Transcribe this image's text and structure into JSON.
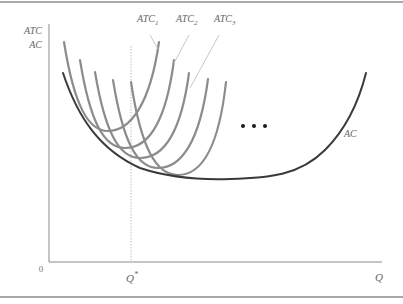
{
  "diagram": {
    "y_axis_label_line1": "ATC",
    "y_axis_label_line2": "AC",
    "x_axis_label": "Q",
    "origin_label": "0",
    "q_star_label": "Q",
    "q_star_superscript": "*",
    "curve_labels": [
      {
        "base": "ATC",
        "sub": "1"
      },
      {
        "base": "ATC",
        "sub": "2"
      },
      {
        "base": "ATC",
        "sub": "3"
      }
    ],
    "ac_label": "AC",
    "ellipsis": "• • •",
    "colors": {
      "atc_curve": "#8c8c8c",
      "ac_curve": "#3a3a3a",
      "axis": "#8a8a8a",
      "leader": "#c8c8c8",
      "border": "#a9a9a9",
      "qstar_line": "#c0c0c0"
    },
    "atc_curve_count": 5
  }
}
